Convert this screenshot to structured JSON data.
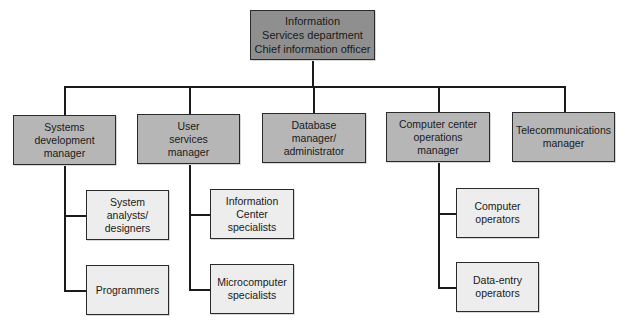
{
  "diagram": {
    "type": "org-chart",
    "colors": {
      "top": "#8f8f8f",
      "manager": "#b6b6b6",
      "staff": "#ededed",
      "line": "#1a1a1a"
    },
    "root": {
      "label": "Information\nServices department\nChief information officer"
    },
    "managers": [
      {
        "label": "Systems\ndevelopment\nmanager",
        "reports": [
          {
            "label": "System\nanalysts/\ndesigners"
          },
          {
            "label": "Programmers"
          }
        ]
      },
      {
        "label": "User\nservices\nmanager",
        "reports": [
          {
            "label": "Information\nCenter\nspecialists"
          },
          {
            "label": "Microcomputer\nspecialists"
          }
        ]
      },
      {
        "label": "Database\nmanager/\nadministrator",
        "reports": []
      },
      {
        "label": "Computer center\noperations\nmanager",
        "reports": [
          {
            "label": "Computer\noperators"
          },
          {
            "label": "Data-entry\noperators"
          }
        ]
      },
      {
        "label": "Telecommunications\nmanager",
        "reports": []
      }
    ]
  }
}
